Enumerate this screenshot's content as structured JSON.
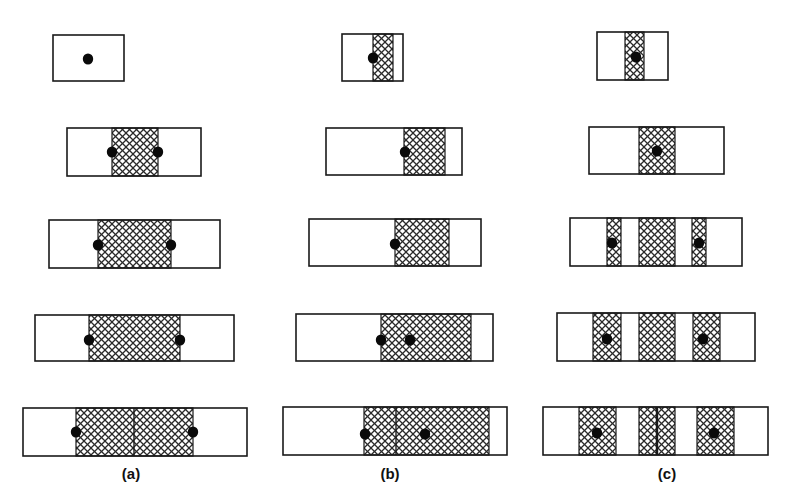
{
  "colors": {
    "stroke": "#1a1a1a",
    "hatch": "#2a2a2a",
    "background": "#ffffff",
    "dot": "#0a0a0a"
  },
  "panels": [
    {
      "label": "(a)",
      "label_x": 131,
      "rows": [
        {
          "rect": [
            53,
            35,
            71,
            46
          ],
          "hatches": [],
          "dividers": [],
          "dots": [
            [
              88,
              59
            ]
          ]
        },
        {
          "rect": [
            67,
            128,
            134,
            48
          ],
          "hatches": [
            [
              112,
              46
            ]
          ],
          "dividers": [],
          "dots": [
            [
              112,
              152
            ],
            [
              158,
              152
            ]
          ]
        },
        {
          "rect": [
            49,
            220,
            171,
            48
          ],
          "hatches": [
            [
              98,
              73
            ]
          ],
          "dividers": [],
          "dots": [
            [
              98,
              245
            ],
            [
              171,
              245
            ]
          ]
        },
        {
          "rect": [
            35,
            315,
            199,
            46
          ],
          "hatches": [
            [
              89,
              91
            ]
          ],
          "dividers": [],
          "dots": [
            [
              89,
              340
            ],
            [
              180,
              340
            ]
          ]
        },
        {
          "rect": [
            23,
            408,
            224,
            48
          ],
          "hatches": [
            [
              76,
              117
            ]
          ],
          "dividers": [
            134
          ],
          "dots": [
            [
              76,
              432
            ],
            [
              193,
              432
            ]
          ]
        }
      ]
    },
    {
      "label": "(b)",
      "label_x": 390,
      "rows": [
        {
          "rect": [
            342,
            34,
            61,
            47
          ],
          "hatches": [
            [
              373,
              20
            ]
          ],
          "dividers": [],
          "dots": [
            [
              373,
              58
            ]
          ]
        },
        {
          "rect": [
            326,
            128,
            136,
            47
          ],
          "hatches": [
            [
              404,
              41
            ]
          ],
          "dividers": [],
          "dots": [
            [
              405,
              152
            ]
          ]
        },
        {
          "rect": [
            309,
            219,
            172,
            47
          ],
          "hatches": [
            [
              395,
              54
            ]
          ],
          "dividers": [],
          "dots": [
            [
              395,
              244
            ]
          ]
        },
        {
          "rect": [
            296,
            314,
            197,
            47
          ],
          "hatches": [
            [
              381,
              90
            ]
          ],
          "dividers": [],
          "dots": [
            [
              381,
              340
            ],
            [
              410,
              340
            ]
          ]
        },
        {
          "rect": [
            283,
            407,
            224,
            48
          ],
          "hatches": [
            [
              364,
              125
            ]
          ],
          "dividers": [
            396
          ],
          "dots": [
            [
              365,
              434
            ],
            [
              425,
              434
            ]
          ]
        }
      ]
    },
    {
      "label": "(c)",
      "label_x": 667,
      "rows": [
        {
          "rect": [
            597,
            32,
            71,
            48
          ],
          "hatches": [
            [
              625,
              19
            ]
          ],
          "dividers": [],
          "dots": [
            [
              636,
              57
            ]
          ]
        },
        {
          "rect": [
            589,
            127,
            135,
            47
          ],
          "hatches": [
            [
              639,
              36
            ]
          ],
          "dividers": [],
          "dots": [
            [
              657,
              151
            ]
          ]
        },
        {
          "rect": [
            570,
            218,
            172,
            48
          ],
          "hatches": [
            [
              607,
              14
            ],
            [
              639,
              36
            ],
            [
              692,
              14
            ]
          ],
          "dividers": [],
          "dots": [
            [
              612,
              243
            ],
            [
              699,
              243
            ]
          ]
        },
        {
          "rect": [
            557,
            313,
            198,
            48
          ],
          "hatches": [
            [
              593,
              28
            ],
            [
              639,
              36
            ],
            [
              693,
              27
            ]
          ],
          "dividers": [],
          "dots": [
            [
              607,
              339
            ],
            [
              703,
              339
            ]
          ]
        },
        {
          "rect": [
            543,
            407,
            225,
            48
          ],
          "hatches": [
            [
              579,
              37
            ],
            [
              639,
              36
            ],
            [
              697,
              37
            ]
          ],
          "dividers": [
            657
          ],
          "dots": [
            [
              597,
              433
            ],
            [
              714,
              433
            ]
          ]
        }
      ]
    }
  ],
  "labels": {
    "a": "(a)",
    "b": "(b)",
    "c": "(c)"
  }
}
